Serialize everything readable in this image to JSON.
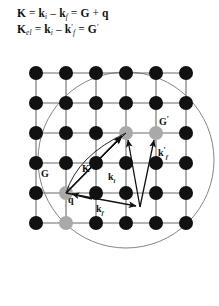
{
  "equations": {
    "line1": {
      "full_text": "K = k_i – k_f = G + q",
      "lhs": "K",
      "term_ki": "k",
      "sub_i": "i",
      "minus": "–",
      "term_kf": "k",
      "sub_f": "f",
      "eq2": "=",
      "term_G": "G",
      "plus": "+",
      "term_q": "q",
      "eq1": "="
    },
    "line2": {
      "full_text": "K_el = k_i – k'_f = G'",
      "lhs": "K",
      "sub_el": "el",
      "term_ki": "k",
      "sub_i": "i",
      "minus": "–",
      "term_kf": "k",
      "prime_f": "′",
      "sub_f": "f",
      "eq2": "=",
      "term_Gp": "G",
      "prime_G": "′",
      "eq1": "="
    }
  },
  "figure": {
    "lattice": {
      "rows": 6,
      "cols": 6,
      "origin_x": 36,
      "origin_y": 23,
      "spacing": 30,
      "dot_radius": 7,
      "dot_color": "#111111",
      "highlight_color": "#a8a8a8",
      "line_color": "#6b6b6b",
      "highlight_nodes": [
        [
          1,
          4
        ],
        [
          1,
          5
        ],
        [
          4,
          2
        ]
      ]
    },
    "circle": {
      "cx": 126,
      "cy": 110,
      "r": 88,
      "stroke": "#777777",
      "label": "ewald-sphere"
    },
    "vectors": [
      {
        "name": "G",
        "x1": 66,
        "y1": 142,
        "x2": 126,
        "y2": 81,
        "label": "G"
      },
      {
        "name": "K",
        "x1": 66,
        "y1": 142,
        "x2": 126,
        "y2": 81,
        "label": "K"
      },
      {
        "name": "k_i",
        "x1": 140,
        "y1": 155,
        "x2": 126,
        "y2": 81,
        "label": "k"
      },
      {
        "name": "k_f",
        "x1": 66,
        "y1": 142,
        "x2": 140,
        "y2": 155,
        "label": "k"
      },
      {
        "name": "q",
        "x1": 92,
        "y1": 148,
        "x2": 66,
        "y2": 142,
        "label": "q"
      },
      {
        "name": "k_f_prime",
        "x1": 140,
        "y1": 155,
        "x2": 156,
        "y2": 81,
        "label": "k"
      }
    ],
    "labels": [
      {
        "name": "label-G",
        "text": "G",
        "sub": "",
        "prime": "",
        "x": 43,
        "y": 125
      },
      {
        "name": "label-K",
        "text": "K",
        "sub": "",
        "prime": "",
        "x": 84,
        "y": 120
      },
      {
        "name": "label-k-i",
        "text": "k",
        "sub": "i",
        "prime": "",
        "x": 110,
        "y": 128
      },
      {
        "name": "label-q",
        "text": "q",
        "sub": "",
        "prime": "",
        "x": 70,
        "y": 150
      },
      {
        "name": "label-k-f",
        "text": "k",
        "sub": "f",
        "prime": "",
        "x": 98,
        "y": 159
      },
      {
        "name": "label-G-prime",
        "text": "G",
        "sub": "",
        "prime": "′",
        "x": 160,
        "y": 73
      },
      {
        "name": "label-k-f-prime",
        "text": "k",
        "sub": "f",
        "prime": "′",
        "x": 159,
        "y": 105
      }
    ]
  }
}
